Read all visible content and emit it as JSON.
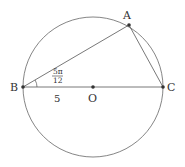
{
  "diagram": {
    "points": {
      "A": {
        "label": "A",
        "x": 129,
        "y": 25
      },
      "B": {
        "label": "B",
        "x": 23,
        "y": 87
      },
      "C": {
        "label": "C",
        "x": 163,
        "y": 87
      },
      "O": {
        "label": "O",
        "x": 93,
        "y": 87
      }
    },
    "circle": {
      "cx": 93,
      "cy": 87,
      "r": 70
    },
    "angle_label": {
      "numerator": "5π",
      "denominator": "12"
    },
    "segment_label": "5",
    "colors": {
      "stroke": "#555555",
      "point": "#333333",
      "text": "#333333"
    }
  }
}
